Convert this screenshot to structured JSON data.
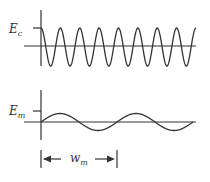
{
  "diagram": {
    "carrier": {
      "label_main": "E",
      "label_sub": "c",
      "cycles": 8,
      "description": "high-frequency carrier wave"
    },
    "modulating": {
      "label_main": "E",
      "label_sub": "m",
      "cycles": 2,
      "description": "low-frequency modulating wave"
    },
    "period_marker": {
      "label_main": "w",
      "label_sub": "m"
    },
    "colors": {
      "stroke": "#333333",
      "background": "#ffffff"
    }
  }
}
